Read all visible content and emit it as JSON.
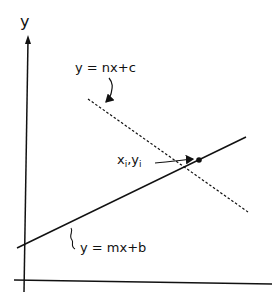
{
  "diagram": {
    "axes": {
      "y_label": "y"
    },
    "lines": [
      {
        "name": "line-1",
        "equation": "y = mx+b",
        "style": "solid"
      },
      {
        "name": "line-2",
        "equation": "y = nx+c",
        "style": "dashed"
      }
    ],
    "intersection": {
      "x_label": "x",
      "x_sub": "i",
      "sep": ",",
      "y_label": "y",
      "y_sub": "i"
    },
    "colors": {
      "ink": "#111111",
      "background": "#ffffff"
    }
  }
}
